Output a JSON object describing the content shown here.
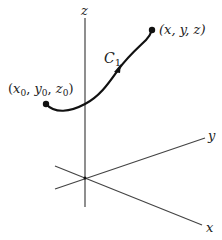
{
  "diagram": {
    "axes": {
      "z_label": "z",
      "y_label": "y",
      "x_label": "x"
    },
    "curve": {
      "name": "C",
      "subscript": "1",
      "start_point_label": {
        "open": "(",
        "x": "x",
        "x_sub": "0",
        "y": "y",
        "y_sub": "0",
        "z": "z",
        "z_sub": "0",
        "close": ")"
      },
      "end_point_label": "(x, y, z)"
    },
    "colors": {
      "line": "#333333",
      "curve": "#111111",
      "background": "#ffffff"
    }
  }
}
